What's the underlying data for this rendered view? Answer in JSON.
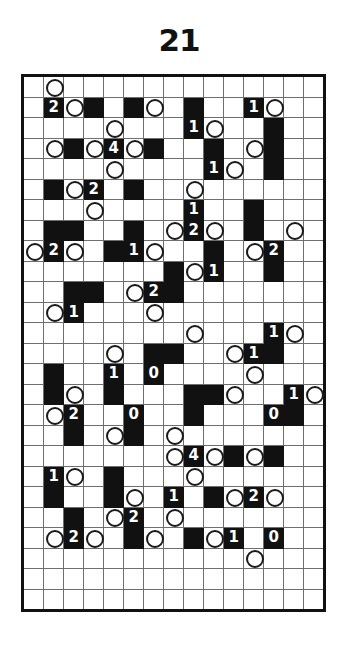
{
  "page": {
    "title": "21",
    "type": "logic-puzzle-grid",
    "colors": {
      "block": "#111111",
      "background": "#ffffff",
      "gridline": "#6e6e6e",
      "border": "#111111",
      "clue_text": "#ffffff",
      "circle_stroke": "#1a1a1a"
    }
  },
  "grid": {
    "columns": 15,
    "rows": 26,
    "cells": [
      [
        {},
        {
          "circle": true
        },
        {},
        {},
        {},
        {},
        {},
        {},
        {},
        {},
        {},
        {},
        {},
        {},
        {}
      ],
      [
        {},
        {
          "block": true,
          "clue": "2"
        },
        {
          "circle": true
        },
        {
          "block": true
        },
        {},
        {
          "block": true
        },
        {
          "circle": true
        },
        {},
        {
          "block": true
        },
        {},
        {},
        {
          "block": true,
          "clue": "1"
        },
        {
          "circle": true
        },
        {},
        {}
      ],
      [
        {},
        {},
        {},
        {},
        {
          "circle": true
        },
        {},
        {},
        {},
        {
          "block": true,
          "clue": "1"
        },
        {
          "circle": true
        },
        {},
        {},
        {
          "block": true
        },
        {},
        {}
      ],
      [
        {},
        {
          "circle": true
        },
        {
          "block": true
        },
        {
          "circle": true
        },
        {
          "block": true,
          "clue": "4"
        },
        {
          "circle": true
        },
        {
          "block": true
        },
        {},
        {},
        {
          "block": true
        },
        {},
        {
          "circle": true
        },
        {
          "block": true
        },
        {},
        {}
      ],
      [
        {},
        {},
        {},
        {},
        {
          "circle": true
        },
        {},
        {},
        {},
        {},
        {
          "block": true,
          "clue": "1"
        },
        {
          "circle": true
        },
        {},
        {
          "block": true
        },
        {},
        {}
      ],
      [
        {},
        {
          "block": true
        },
        {
          "circle": true
        },
        {
          "block": true,
          "clue": "2"
        },
        {},
        {
          "block": true
        },
        {},
        {},
        {
          "circle": true
        },
        {},
        {},
        {},
        {},
        {},
        {}
      ],
      [
        {},
        {},
        {},
        {
          "circle": true
        },
        {},
        {},
        {},
        {},
        {
          "block": true,
          "clue": "1"
        },
        {},
        {},
        {
          "block": true
        },
        {},
        {},
        {}
      ],
      [
        {},
        {
          "block": true
        },
        {
          "block": true
        },
        {},
        {},
        {
          "block": true
        },
        {},
        {
          "circle": true
        },
        {
          "block": true,
          "clue": "2"
        },
        {
          "circle": true
        },
        {},
        {
          "block": true
        },
        {},
        {
          "circle": true
        },
        {}
      ],
      [
        {
          "circle": true
        },
        {
          "block": true,
          "clue": "2"
        },
        {
          "circle": true
        },
        {},
        {
          "block": true
        },
        {
          "block": true,
          "clue": "1"
        },
        {
          "circle": true
        },
        {},
        {},
        {
          "block": true
        },
        {},
        {
          "circle": true
        },
        {
          "block": true,
          "clue": "2"
        },
        {},
        {}
      ],
      [
        {},
        {},
        {},
        {},
        {},
        {},
        {},
        {
          "block": true
        },
        {
          "circle": true
        },
        {
          "block": true,
          "clue": "1"
        },
        {},
        {},
        {
          "block": true
        },
        {},
        {}
      ],
      [
        {},
        {},
        {
          "block": true
        },
        {
          "block": true
        },
        {},
        {
          "circle": true
        },
        {
          "block": true,
          "clue": "2"
        },
        {
          "block": true
        },
        {},
        {},
        {},
        {},
        {},
        {},
        {}
      ],
      [
        {},
        {
          "circle": true
        },
        {
          "block": true,
          "clue": "1"
        },
        {},
        {},
        {},
        {
          "circle": true
        },
        {},
        {},
        {},
        {},
        {},
        {},
        {},
        {}
      ],
      [
        {},
        {},
        {},
        {},
        {},
        {},
        {},
        {},
        {
          "circle": true
        },
        {},
        {},
        {},
        {
          "block": true,
          "clue": "1"
        },
        {
          "circle": true
        },
        {}
      ],
      [
        {},
        {},
        {},
        {},
        {
          "circle": true
        },
        {},
        {
          "block": true
        },
        {
          "block": true
        },
        {},
        {},
        {
          "circle": true
        },
        {
          "block": true,
          "clue": "1"
        },
        {
          "block": true
        },
        {},
        {}
      ],
      [
        {},
        {
          "block": true
        },
        {},
        {},
        {
          "block": true,
          "clue": "1"
        },
        {},
        {
          "block": true,
          "clue": "0"
        },
        {},
        {},
        {},
        {},
        {
          "circle": true
        },
        {},
        {},
        {}
      ],
      [
        {},
        {
          "block": true
        },
        {
          "circle": true
        },
        {},
        {
          "block": true
        },
        {},
        {},
        {},
        {
          "block": true
        },
        {
          "block": true
        },
        {
          "circle": true
        },
        {},
        {},
        {
          "block": true,
          "clue": "1"
        },
        {
          "circle": true
        }
      ],
      [
        {},
        {
          "circle": true
        },
        {
          "block": true,
          "clue": "2"
        },
        {},
        {},
        {
          "block": true,
          "clue": "0"
        },
        {},
        {},
        {
          "block": true
        },
        {},
        {},
        {},
        {
          "block": true,
          "clue": "0"
        },
        {
          "block": true
        },
        {}
      ],
      [
        {},
        {},
        {
          "block": true
        },
        {},
        {
          "circle": true
        },
        {
          "block": true
        },
        {},
        {
          "circle": true
        },
        {},
        {},
        {},
        {},
        {},
        {},
        {}
      ],
      [
        {},
        {},
        {},
        {},
        {},
        {},
        {},
        {
          "circle": true
        },
        {
          "block": true,
          "clue": "4"
        },
        {
          "circle": true
        },
        {
          "block": true
        },
        {
          "circle": true
        },
        {
          "block": true
        },
        {},
        {}
      ],
      [
        {},
        {
          "block": true,
          "clue": "1"
        },
        {
          "circle": true
        },
        {},
        {
          "block": true
        },
        {},
        {},
        {},
        {
          "circle": true
        },
        {},
        {},
        {},
        {},
        {},
        {}
      ],
      [
        {},
        {
          "block": true
        },
        {},
        {},
        {
          "block": true
        },
        {
          "circle": true
        },
        {},
        {
          "block": true,
          "clue": "1"
        },
        {},
        {
          "block": true
        },
        {
          "circle": true
        },
        {
          "block": true,
          "clue": "2"
        },
        {
          "circle": true
        },
        {},
        {}
      ],
      [
        {},
        {},
        {
          "block": true
        },
        {},
        {
          "circle": true
        },
        {
          "block": true,
          "clue": "2"
        },
        {},
        {
          "circle": true
        },
        {},
        {},
        {},
        {},
        {},
        {},
        {}
      ],
      [
        {},
        {
          "circle": true
        },
        {
          "block": true,
          "clue": "2"
        },
        {
          "circle": true
        },
        {},
        {
          "block": true
        },
        {
          "circle": true
        },
        {},
        {
          "block": true
        },
        {
          "circle": true
        },
        {
          "block": true,
          "clue": "1"
        },
        {},
        {
          "block": true,
          "clue": "0"
        },
        {},
        {}
      ],
      [
        {},
        {},
        {},
        {},
        {},
        {},
        {},
        {},
        {},
        {},
        {},
        {
          "circle": true
        },
        {},
        {},
        {}
      ],
      [
        {},
        {},
        {},
        {},
        {},
        {},
        {},
        {},
        {},
        {},
        {},
        {},
        {},
        {},
        {}
      ],
      [
        {},
        {},
        {},
        {},
        {},
        {},
        {},
        {},
        {},
        {},
        {},
        {},
        {},
        {},
        {}
      ]
    ]
  }
}
